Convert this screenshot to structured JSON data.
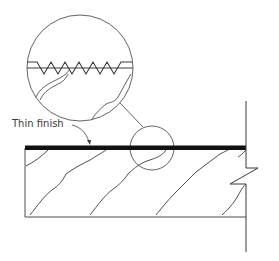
{
  "diagram": {
    "type": "construction-section-detail",
    "labels": {
      "thin_finish": "Thin finish"
    },
    "colors": {
      "stroke": "#3a3a3a",
      "finish": "#111111",
      "background": "#ffffff"
    },
    "elements": [
      "slab-section",
      "thin-finish-layer",
      "wall-line",
      "break-symbol",
      "detail-callout-circle",
      "magnified-detail-circle",
      "callout-leader",
      "label-arrow"
    ]
  }
}
